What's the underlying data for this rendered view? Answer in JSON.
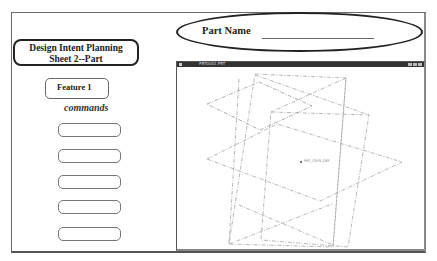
{
  "sheet": {
    "title_line1": "Design Intent Planning",
    "title_line2": "Sheet 2--Part",
    "feature_label": "Feature 1",
    "commands_label": "commands",
    "command_slots": [
      "",
      "",
      "",
      "",
      ""
    ],
    "part_name_label": "Part Name",
    "part_name_value": ""
  },
  "viewport": {
    "window_title": "PRT0001.PRT",
    "datum_labels": {
      "origin": "PRT_CSYS_DEF",
      "top": "TOP",
      "front": "FRONT",
      "right": "RIGHT"
    },
    "line_color": "#9a9a9a"
  }
}
